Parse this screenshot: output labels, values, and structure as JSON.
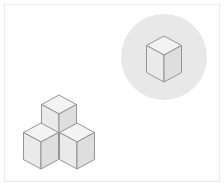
{
  "figure": {
    "title": "Isometric cube arrangement with highlighted single cube",
    "width": 224,
    "height": 186,
    "background_color": "#ffffff",
    "border_color": "#e9e9e9",
    "border_width": 1,
    "alt_text": "Three unit cubes arranged in an L shape at lower left, and one single unit cube inside a light gray circle at upper right."
  },
  "style": {
    "face_top_color": "#f3f3f3",
    "face_left_color": "#eaeaea",
    "face_right_color": "#dedede",
    "edge_color": "#8a8a8a",
    "edge_width": 0.9,
    "circle_fill_color": "#e8e8e8"
  },
  "highlight_circle": {
    "label": "highlight circle",
    "center_x": 164,
    "center_y": 57,
    "radius": 43,
    "fill": "#e8e8e8"
  },
  "geometry": {
    "cube_half_width": 17.5,
    "cube_half_depth": 9.5,
    "cube_height": 27,
    "note": "isometric projection: x offset = half_width, y offset = half_depth"
  },
  "cube_group": {
    "label": "three-cube L arrangement",
    "cube_count": 3,
    "cubes": [
      {
        "name": "back-top-cube",
        "apex_x": 59,
        "apex_y": 95
      },
      {
        "name": "front-left-cube",
        "apex_x": 41,
        "apex_y": 123
      },
      {
        "name": "front-right-cube",
        "apex_x": 77,
        "apex_y": 123
      }
    ]
  },
  "single_cube": {
    "label": "single highlighted cube",
    "name": "single-cube",
    "apex_x": 164,
    "apex_y": 36
  },
  "chart_data": {
    "type": "diagram",
    "title": "Isometric cube arrangement with highlighted single cube",
    "elements": [
      {
        "kind": "cube-group",
        "count": 3,
        "position": "lower-left",
        "shape": "L / T arrangement"
      },
      {
        "kind": "circle",
        "position": "upper-right",
        "fill": "#e8e8e8"
      },
      {
        "kind": "cube",
        "count": 1,
        "position": "upper-right inside circle"
      }
    ]
  }
}
